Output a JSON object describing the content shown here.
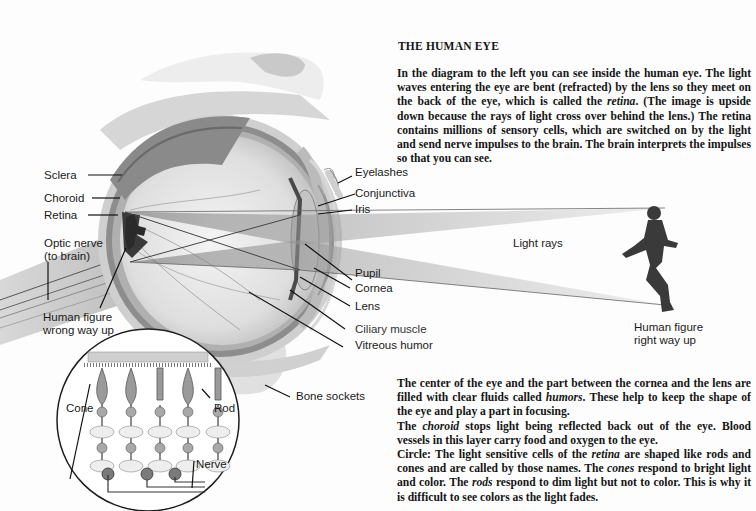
{
  "title": "THE HUMAN EYE",
  "intro": {
    "p1_a": "In the diagram to the left you can see inside the human eye. The light waves entering the eye are bent (refracted) by the lens so they meet on the back of the eye, which is called the ",
    "p1_em": "retina",
    "p1_b": ". (The image is upside down because the rays of light cross over behind the lens.) The retina contains millions of sensory cells, which are switched on by the light and send nerve impulses to the brain. The brain interprets the impulses so that you can see."
  },
  "notes": {
    "humors_a": "The center of the eye and the part between the cornea and the lens are filled with clear fluids called ",
    "humors_em": "humors",
    "humors_b": ". These help to keep the shape of the eye and play a part in focusing.",
    "choroid_a": "The ",
    "choroid_em": "choroid",
    "choroid_b": " stops light being reflected back out of the eye. Blood vessels in this layer carry food and oxygen to the eye.",
    "circle_a": "Circle: The light sensitive cells of the ",
    "circle_em1": "retina",
    "circle_b": " are shaped like rods and cones and are called by those names. The ",
    "circle_em2": "cones",
    "circle_c": " respond to bright light and color. The ",
    "circle_em3": "rods",
    "circle_d": " respond to dim light but not to color. This is why it is difficult to see colors as the light fades."
  },
  "labels": {
    "sclera": "Sclera",
    "choroid": "Choroid",
    "retina": "Retina",
    "optic_nerve_1": "Optic nerve",
    "optic_nerve_2": "(to brain)",
    "figure_wrong_1": "Human figure",
    "figure_wrong_2": "wrong way up",
    "eyelashes": "Eyelashes",
    "conjunctiva": "Conjunctiva",
    "iris": "Iris",
    "light_rays": "Light rays",
    "pupil": "Pupil",
    "cornea": "Cornea",
    "lens": "Lens",
    "ciliary_muscle": "Ciliary muscle",
    "vitreous_humor": "Vitreous humor",
    "figure_right_1": "Human figure",
    "figure_right_2": "right way up",
    "bone_sockets": "Bone sockets",
    "cone": "Cone",
    "rod": "Rod",
    "nerve": "Nerve"
  }
}
